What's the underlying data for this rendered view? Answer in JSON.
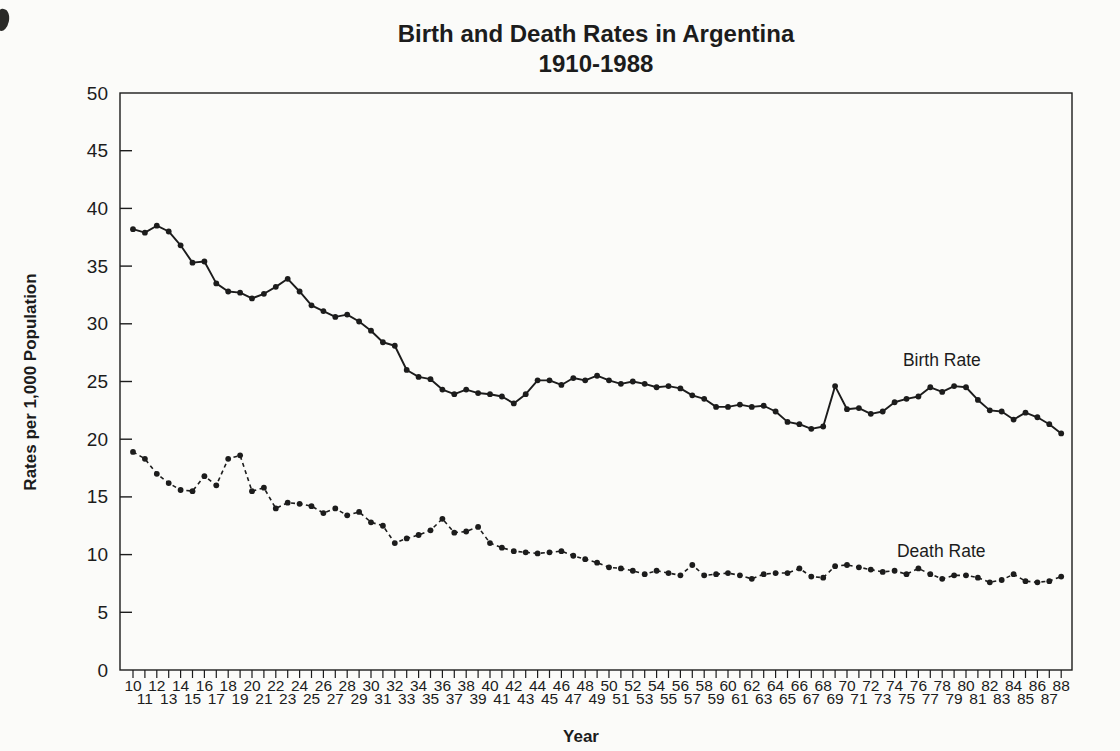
{
  "chart": {
    "title": "Birth and Death Rates in Argentina",
    "subtitle": "1910-1988",
    "y_axis_title": "Rates per 1,000 Population",
    "x_axis_title": "Year",
    "colors": {
      "ink": "#1c1c1c",
      "background": "#fbfbf9"
    }
  },
  "chart_data": {
    "type": "line",
    "title": "Birth and Death Rates in Argentina",
    "subtitle": "1910-1988",
    "xlabel": "Year",
    "ylabel": "Rates per 1,000 Population",
    "ylim": [
      0,
      50
    ],
    "ytick_step": 5,
    "grid": false,
    "x": [
      10,
      11,
      12,
      13,
      14,
      15,
      16,
      17,
      18,
      19,
      20,
      21,
      22,
      23,
      24,
      25,
      26,
      27,
      28,
      29,
      30,
      31,
      32,
      33,
      34,
      35,
      36,
      37,
      38,
      39,
      40,
      41,
      42,
      43,
      44,
      45,
      46,
      47,
      48,
      49,
      50,
      51,
      52,
      53,
      54,
      55,
      56,
      57,
      58,
      59,
      60,
      61,
      62,
      63,
      64,
      65,
      66,
      67,
      68,
      69,
      70,
      71,
      72,
      73,
      74,
      75,
      76,
      77,
      78,
      79,
      80,
      81,
      82,
      83,
      84,
      85,
      86,
      87,
      88
    ],
    "series": [
      {
        "name": "Birth Rate",
        "line_style": "solid",
        "marker": "dot",
        "values": [
          38.2,
          37.9,
          38.5,
          38.0,
          36.8,
          35.3,
          35.4,
          33.5,
          32.8,
          32.7,
          32.2,
          32.6,
          33.2,
          33.9,
          32.8,
          31.6,
          31.1,
          30.6,
          30.8,
          30.2,
          29.4,
          28.4,
          28.1,
          26.0,
          25.4,
          25.2,
          24.3,
          23.9,
          24.3,
          24.0,
          23.9,
          23.7,
          23.1,
          23.9,
          25.1,
          25.1,
          24.7,
          25.3,
          25.1,
          25.5,
          25.1,
          24.8,
          25.0,
          24.8,
          24.5,
          24.6,
          24.4,
          23.8,
          23.5,
          22.8,
          22.8,
          23.0,
          22.8,
          22.9,
          22.4,
          21.5,
          21.3,
          20.9,
          21.1,
          24.6,
          22.6,
          22.7,
          22.2,
          22.4,
          23.2,
          23.5,
          23.7,
          24.5,
          24.1,
          24.6,
          24.5,
          23.4,
          22.5,
          22.4,
          21.7,
          22.3,
          21.9,
          21.3,
          20.5
        ]
      },
      {
        "name": "Death Rate",
        "line_style": "dashed",
        "marker": "dot",
        "values": [
          18.9,
          18.3,
          17.0,
          16.2,
          15.6,
          15.5,
          16.8,
          16.0,
          18.3,
          18.6,
          15.5,
          15.8,
          14.0,
          14.5,
          14.4,
          14.2,
          13.6,
          14.0,
          13.4,
          13.7,
          12.8,
          12.5,
          11.0,
          11.4,
          11.7,
          12.1,
          13.1,
          11.9,
          12.0,
          12.4,
          11.0,
          10.6,
          10.3,
          10.2,
          10.1,
          10.2,
          10.3,
          9.9,
          9.6,
          9.3,
          8.9,
          8.8,
          8.6,
          8.3,
          8.6,
          8.4,
          8.2,
          9.1,
          8.2,
          8.3,
          8.4,
          8.2,
          7.9,
          8.3,
          8.4,
          8.4,
          8.8,
          8.1,
          8.0,
          9.0,
          9.1,
          8.9,
          8.7,
          8.5,
          8.6,
          8.3,
          8.8,
          8.3,
          7.9,
          8.2,
          8.2,
          8.0,
          7.6,
          7.8,
          8.3,
          7.7,
          7.6,
          7.7,
          8.1
        ]
      }
    ],
    "annotations": [
      {
        "text": "Birth Rate",
        "x": 74.7,
        "y": 26.3
      },
      {
        "text": "Death Rate",
        "x": 74.2,
        "y": 9.8
      }
    ],
    "legend_position": "inline-annotations"
  }
}
